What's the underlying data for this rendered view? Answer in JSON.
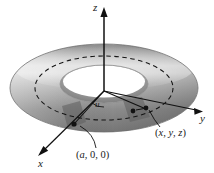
{
  "figure": {
    "type": "3d-torus-parametrization-diagram",
    "background_color": "#ffffff"
  },
  "axes": {
    "z": {
      "label": "z",
      "direction": "up"
    },
    "y": {
      "label": "y",
      "direction": "right"
    },
    "x": {
      "label": "x",
      "direction": "down-left"
    },
    "color": "#111111"
  },
  "annotations": {
    "angle_u": {
      "label": "u"
    },
    "point_a": {
      "label": "(a, 0, 0)",
      "open": "(",
      "x": "a",
      "sep1": ", ",
      "y": "0",
      "sep2": ", ",
      "z": "0",
      "close": ")"
    },
    "point_xyz": {
      "label": "(x, y, z)",
      "open": "(",
      "x": "x",
      "sep1": ", ",
      "y": "y",
      "sep2": ", ",
      "z": "z",
      "close": ")"
    }
  },
  "torus": {
    "outer_color": "#9a9a9a",
    "highlight_color": "#d8d8d8",
    "shadow_color": "#6e6e6e",
    "hole_color": "#ffffff",
    "dashed_circle_color": "#1a1a1a"
  }
}
